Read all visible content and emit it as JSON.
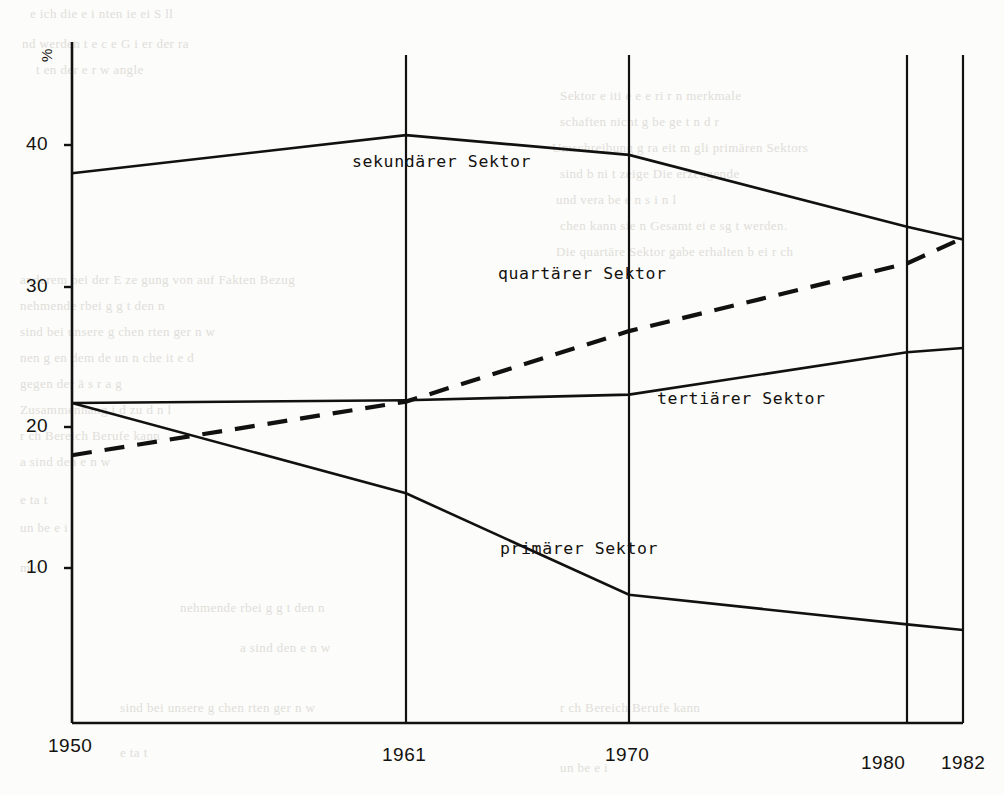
{
  "document": {
    "kind": "scanned-page-chart",
    "background_bleed_lines": [
      "e ich die         e i        nten      ie   ei  S  ll  ",
      "nd    werden  t  e     c    e    G  i   er    der   ra",
      "   t en   der          e    r        w         angle",
      "Sektor  e iti  e    e  e    ri   r     n     merkmale",
      "schaften  nicht  g   be       ge      t         n d  r",
      "Umschreibung  g   ra   eit     m  gli   primären Sektors",
      "sind   b   ni   t             zeige      Die  erzeugende",
      "und  vera  be  e    n    s    i  n       l      ",
      "chen kann sie  n   Gesamt   ei  e     sg    t  werden.",
      "Die  quartäre   Sektor       gabe  erhalten  b  ei  r  ch",
      "anderem  bei  der  E  ze  gung  von  auf  Fakten  Bezug",
      "nehmende    rbei      g  g    t  den    n     ",
      "sind  bei  unsere   g   chen   rten   ger         n  w",
      "nen   g   en dem   de   un   n     che    it      e  d",
      "gegen  der      ä   s  r      a        g      ",
      "Zusammenhang    i  d  zu d      n  l",
      "r    ch                Bereich               Berufe  kann",
      "       a  sind  den           e       n        w",
      "                      e   ta                t      ",
      "               un  be     e     i                  ",
      "                     m    c                        "
    ]
  },
  "chart_data": {
    "type": "line",
    "title": "",
    "xlabel": "",
    "ylabel": "%",
    "x": [
      1950,
      1961,
      1970,
      1980,
      1982
    ],
    "xticklabels": [
      "1950",
      "1961",
      "1970",
      "1980",
      "1982"
    ],
    "yticks": [
      10,
      20,
      30,
      40
    ],
    "yticklabels": [
      "10",
      "20",
      "30",
      "40"
    ],
    "ylim": [
      0,
      45
    ],
    "xlim": [
      1950,
      1982
    ],
    "grid": false,
    "gridlines_vertical": [
      1950,
      1961,
      1970,
      1980,
      1982
    ],
    "legend": "inline-labels",
    "series": [
      {
        "name": "sekundärer Sektor",
        "label": "sekundärer Sektor",
        "style": "solid",
        "color": "#111111",
        "x": [
          1950,
          1961,
          1970,
          1980,
          1982
        ],
        "values": [
          38.0,
          40.7,
          39.3,
          34.2,
          33.3
        ]
      },
      {
        "name": "quartärer Sektor",
        "label": "quartärer Sektor",
        "style": "dashed",
        "color": "#111111",
        "x": [
          1950,
          1961,
          1970,
          1980,
          1982
        ],
        "values": [
          18.0,
          21.8,
          26.8,
          31.6,
          33.4
        ]
      },
      {
        "name": "tertiärer Sektor",
        "label": "tertiärer Sektor",
        "style": "solid",
        "color": "#111111",
        "x": [
          1950,
          1961,
          1970,
          1980,
          1982
        ],
        "values": [
          21.7,
          21.9,
          22.3,
          25.3,
          25.6
        ]
      },
      {
        "name": "primärer Sektor",
        "label": "primärer Sektor",
        "style": "solid",
        "color": "#111111",
        "x": [
          1950,
          1961,
          1970,
          1980,
          1982
        ],
        "values": [
          21.7,
          15.3,
          8.1,
          6.0,
          5.6
        ]
      }
    ],
    "annotations": [
      {
        "text": "sekundärer Sektor",
        "x_px": 352,
        "y_px": 153
      },
      {
        "text": "quartärer Sektor",
        "x_px": 498,
        "y_px": 265
      },
      {
        "text": "tertiärer Sektor",
        "x_px": 657,
        "y_px": 390
      },
      {
        "text": "primärer Sektor",
        "x_px": 500,
        "y_px": 540
      }
    ]
  }
}
